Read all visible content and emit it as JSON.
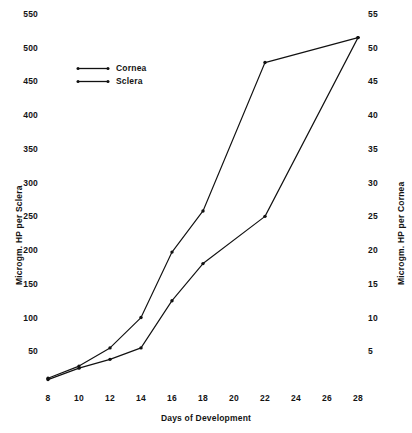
{
  "chart_data": {
    "type": "line",
    "title": "",
    "subtitle": "",
    "xlabel": "Days of Development",
    "ylabel": "Microgm. HP per Sclera",
    "ylabel_right": "Microgm. HP per Cornea",
    "x": [
      8,
      10,
      12,
      14,
      16,
      18,
      20,
      22,
      24,
      26,
      28
    ],
    "xlim": [
      8,
      28
    ],
    "xticks": [
      8,
      10,
      12,
      14,
      16,
      18,
      20,
      22,
      24,
      26,
      28
    ],
    "xticklabels": [
      "8",
      "10",
      "12",
      "14",
      "16",
      "18",
      "20",
      "22",
      "24",
      "26",
      "28"
    ],
    "ylim": [
      0,
      550
    ],
    "yticks": [
      50,
      100,
      150,
      200,
      250,
      300,
      350,
      400,
      450,
      500,
      550
    ],
    "yticklabels": [
      "50",
      "100",
      "150",
      "200",
      "250",
      "300",
      "350",
      "400",
      "450",
      "500",
      "550"
    ],
    "ylim_right": [
      0,
      55
    ],
    "yticks_right": [
      5,
      10,
      15,
      20,
      25,
      30,
      35,
      40,
      45,
      50,
      55
    ],
    "yticklabels_right": [
      "5",
      "10",
      "15",
      "20",
      "25",
      "30",
      "35",
      "40",
      "45",
      "50",
      "55"
    ],
    "grid": false,
    "frame": false,
    "legend_position": "upper-left-inside",
    "marker": "dot",
    "line_color": "#111111",
    "series": [
      {
        "name": "Cornea",
        "axis": "right",
        "x": [
          8,
          10,
          12,
          14,
          16,
          18,
          22,
          28
        ],
        "values": [
          0.8,
          2.5,
          3.8,
          5.5,
          12.5,
          18.0,
          25.0,
          51.5
        ]
      },
      {
        "name": "Sclera",
        "axis": "left",
        "x": [
          8,
          10,
          12,
          14,
          16,
          18,
          22,
          28
        ],
        "values": [
          10,
          28,
          55,
          100,
          197,
          258,
          478,
          515
        ]
      }
    ]
  },
  "legend": {
    "entries": [
      {
        "label": "Cornea"
      },
      {
        "label": "Sclera"
      }
    ]
  },
  "axes": {
    "x_title": "Days of Development",
    "y_left_title": "Microgm. HP per Sclera",
    "y_right_title": "Microgm. HP per Cornea"
  }
}
